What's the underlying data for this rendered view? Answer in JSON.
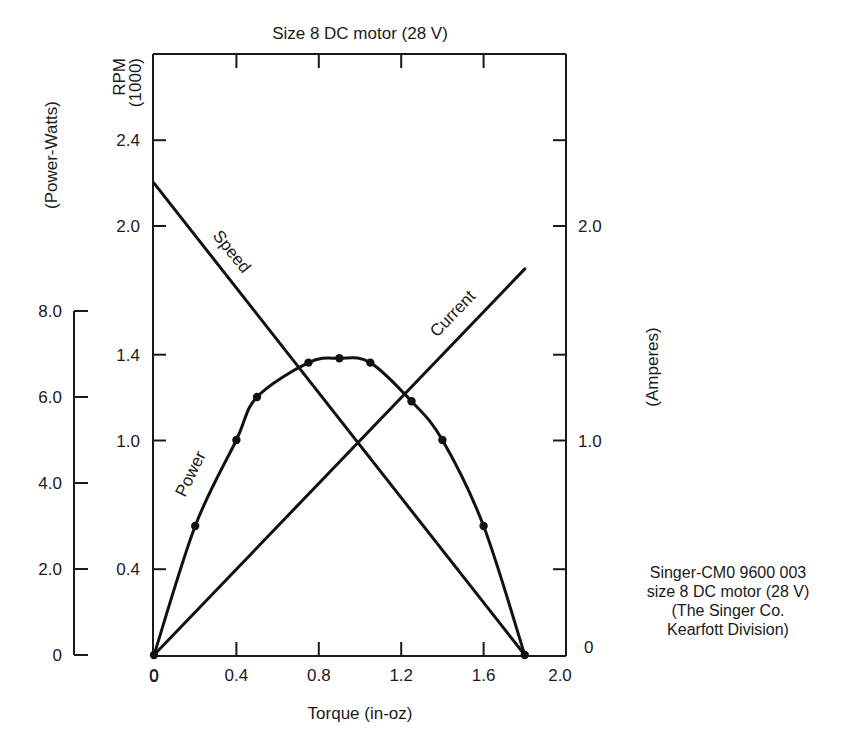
{
  "chart_data": {
    "type": "line",
    "title": "Size 8 DC motor (28 V)",
    "xlabel": "Torque (in-oz)",
    "xlim": [
      0,
      2.0
    ],
    "x_ticks": [
      0,
      0.4,
      0.8,
      1.2,
      1.6,
      2.0
    ],
    "x_tick_labels": [
      "0",
      "0.4",
      "0.8",
      "1.2",
      "1.6",
      "2.0"
    ],
    "axes": {
      "rpm": {
        "label_line1": "RPM",
        "label_line2": "(1000)",
        "side": "left-inner",
        "ylim": [
          0,
          2.6
        ],
        "ticks": [
          0,
          0.4,
          1.0,
          1.4,
          2.0,
          2.4
        ],
        "tick_labels": [
          "0.4",
          "1.0",
          "1.4",
          "2.0",
          "2.4"
        ]
      },
      "power": {
        "label": "(Power-Watts)",
        "side": "left-outer",
        "ylim": [
          0,
          8.0
        ],
        "ticks": [
          0,
          2.0,
          4.0,
          6.0,
          8.0
        ],
        "tick_labels": [
          "0",
          "2.0",
          "4.0",
          "6.0",
          "8.0"
        ]
      },
      "current": {
        "label": "(Amperes)",
        "side": "right",
        "ylim": [
          0,
          2.6
        ],
        "ticks": [
          0,
          0.4,
          1.0,
          1.4,
          2.0,
          2.4
        ],
        "tick_labels": [
          "0",
          "1.0",
          "2.0"
        ]
      }
    },
    "series": [
      {
        "name": "Speed",
        "axis": "rpm",
        "x": [
          0,
          1.8
        ],
        "values": [
          2.2,
          0
        ]
      },
      {
        "name": "Current",
        "axis": "current",
        "x": [
          0,
          1.8
        ],
        "values": [
          0,
          1.8
        ]
      },
      {
        "name": "Power",
        "axis": "power",
        "x": [
          0,
          0.2,
          0.4,
          0.5,
          0.75,
          0.9,
          1.05,
          1.25,
          1.4,
          1.6,
          1.8
        ],
        "values": [
          0,
          3.0,
          5.0,
          6.0,
          6.8,
          6.9,
          6.8,
          5.9,
          5.0,
          3.0,
          0
        ],
        "markers": true
      }
    ],
    "annotations": {
      "origin_label": "0",
      "right_zero_label": "0",
      "note": [
        "Singer-CM0 9600 003",
        "size 8 DC motor (28 V)",
        "(The Singer Co.",
        "Kearfott Division)"
      ]
    },
    "grid": false,
    "legend": "inline curve labels"
  }
}
